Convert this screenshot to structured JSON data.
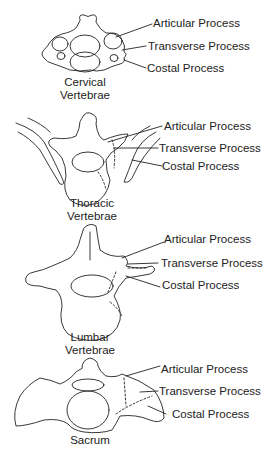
{
  "panels": [
    {
      "name": "Cervical Vertebrae",
      "caption_lines": [
        "Cervical",
        "Vertebrae"
      ],
      "labels": [
        "Articular Process",
        "Transverse Process",
        "Costal Process"
      ]
    },
    {
      "name": "Thoracic Vertebrae",
      "caption_lines": [
        "Thoracic",
        "Vertebrae"
      ],
      "labels": [
        "Articular Process",
        "Transverse Process",
        "Costal Process"
      ]
    },
    {
      "name": "Lumbar Vertebrae",
      "caption_lines": [
        "Lumbar",
        "Vertebrae"
      ],
      "labels": [
        "Articular Process",
        "Transverse Process",
        "Costal Process"
      ]
    },
    {
      "name": "Sacrum",
      "caption_lines": [
        "Sacrum"
      ],
      "labels": [
        "Articular Process",
        "Transverse Process",
        "Costal Process"
      ]
    }
  ]
}
